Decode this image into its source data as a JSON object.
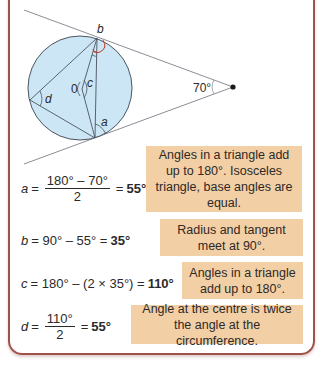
{
  "diagram": {
    "labels": {
      "a": "a",
      "b": "b",
      "c": "c",
      "d": "d",
      "centre": "0",
      "external_angle": "70°"
    },
    "colors": {
      "circle_fill": "#cde6f6",
      "circle_stroke": "#4a5560",
      "line": "#8a8f96",
      "arc_red": "#c0392b",
      "note_bg": "#f3cfa6",
      "frame": "#a0524a"
    }
  },
  "steps": [
    {
      "variable": "a",
      "equals": "=",
      "numerator": "180° – 70°",
      "denominator": "2",
      "result_prefix": "=",
      "result": "55°",
      "note": "Angles in a triangle add up to 180°. Isosceles triangle, base angles are equal."
    },
    {
      "variable": "b",
      "expression": "= 90° – 55° =",
      "result": "35°",
      "note": "Radius and tangent meet at 90°."
    },
    {
      "variable": "c",
      "expression": "= 180° – (2 × 35°) =",
      "result": "110°",
      "note": "Angles in a triangle add up to 180°."
    },
    {
      "variable": "d",
      "equals": "=",
      "numerator": "110°",
      "denominator": "2",
      "result_prefix": "=",
      "result": "55°",
      "note": "Angle at the centre is twice the angle at the circumference."
    }
  ]
}
